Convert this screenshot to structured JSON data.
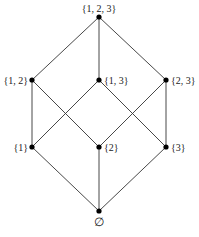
{
  "diagram": {
    "type": "hasse-diagram",
    "line_color": "#333333",
    "node_color": "#000000",
    "nodes": [
      {
        "id": "n123",
        "label": "{1, 2, 3}",
        "x": 99,
        "y": 17,
        "lx": 99,
        "ly": 12,
        "anchor": "middle"
      },
      {
        "id": "n12",
        "label": "{1, 2}",
        "x": 32,
        "y": 80,
        "lx": 28,
        "ly": 84,
        "anchor": "end"
      },
      {
        "id": "n13",
        "label": "{1, 3}",
        "x": 99,
        "y": 80,
        "lx": 104,
        "ly": 84,
        "anchor": "start"
      },
      {
        "id": "n23",
        "label": "{2, 3}",
        "x": 166,
        "y": 80,
        "lx": 171,
        "ly": 84,
        "anchor": "start"
      },
      {
        "id": "n1",
        "label": "{1}",
        "x": 32,
        "y": 147,
        "lx": 28,
        "ly": 151,
        "anchor": "end"
      },
      {
        "id": "n2",
        "label": "{2}",
        "x": 99,
        "y": 147,
        "lx": 104,
        "ly": 151,
        "anchor": "start"
      },
      {
        "id": "n3",
        "label": "{3}",
        "x": 166,
        "y": 147,
        "lx": 171,
        "ly": 151,
        "anchor": "start"
      },
      {
        "id": "n0",
        "label": "∅",
        "x": 99,
        "y": 211,
        "lx": 99,
        "ly": 226,
        "anchor": "middle"
      }
    ],
    "edges": [
      [
        "n123",
        "n12"
      ],
      [
        "n123",
        "n13"
      ],
      [
        "n123",
        "n23"
      ],
      [
        "n12",
        "n1"
      ],
      [
        "n12",
        "n2"
      ],
      [
        "n13",
        "n1"
      ],
      [
        "n13",
        "n3"
      ],
      [
        "n23",
        "n2"
      ],
      [
        "n23",
        "n3"
      ],
      [
        "n1",
        "n0"
      ],
      [
        "n2",
        "n0"
      ],
      [
        "n3",
        "n0"
      ]
    ]
  }
}
